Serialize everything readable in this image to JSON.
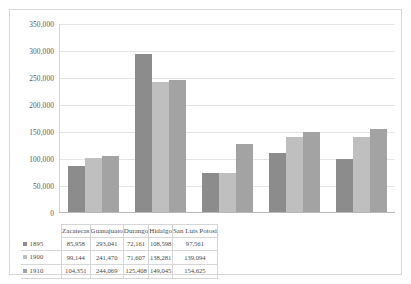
{
  "chart_data": {
    "type": "bar",
    "title": "",
    "subtitle": "",
    "xlabel": "",
    "ylabel": "",
    "categories": [
      "Zacatecas",
      "Guanajuato",
      "Durango",
      "Hidalgo",
      "San Luis Potosi"
    ],
    "series": [
      {
        "name": "1895",
        "color": "#8c8c8c",
        "values": [
          85958,
          293041,
          72161,
          108598,
          97561
        ],
        "labels": [
          "85,958",
          "293,041",
          "72,161",
          "108,598",
          "97,561"
        ]
      },
      {
        "name": "1900",
        "color": "#bfbfbf",
        "values": [
          99144,
          241470,
          71607,
          138281,
          139094
        ],
        "labels": [
          "99,144",
          "241,470",
          "71,607",
          "138,281",
          "139,094"
        ]
      },
      {
        "name": "1910",
        "color": "#a3a3a3",
        "values": [
          104351,
          244069,
          125408,
          149045,
          154625
        ],
        "labels": [
          "104,351",
          "244,069",
          "125,408",
          "149,045",
          "154,625"
        ]
      }
    ],
    "ylim": [
      0,
      350000
    ],
    "ytick_values": [
      0,
      50000,
      100000,
      150000,
      200000,
      250000,
      300000,
      350000
    ],
    "ytick_labels": [
      "0",
      "50,000",
      "100,000",
      "150,000",
      "200,000",
      "250,000",
      "300,000",
      "350,000"
    ],
    "grid": true,
    "legend_position": "data-table-left",
    "has_data_table": true
  },
  "table": {
    "corner_label": "",
    "row_header_icon": "legend-swatch-icon"
  }
}
